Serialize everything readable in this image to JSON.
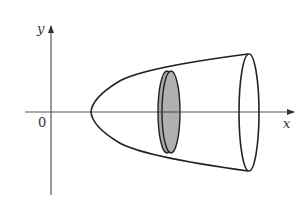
{
  "figure": {
    "axes": {
      "x_label": "x",
      "y_label": "y",
      "origin_label": "0"
    },
    "colors": {
      "stroke": "#222222",
      "disk_fill": "#a9a9a9",
      "background": "#ffffff"
    }
  }
}
